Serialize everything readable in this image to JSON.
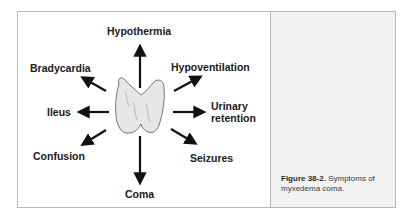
{
  "figure": {
    "number_label": "Figure 38-2.",
    "caption_text": " Symptoms of myxedema coma.",
    "center_image": "thyroid-gland"
  },
  "symptoms": {
    "top": "Hypothermia",
    "top_left": "Bradycardia",
    "top_right": "Hypoventilation",
    "left": "Ileus",
    "right_line1": "Urinary",
    "right_line2": "retention",
    "bottom_left": "Confusion",
    "bottom_right": "Seizures",
    "bottom": "Coma"
  },
  "colors": {
    "border": "#b8b8b8",
    "caption_bg": "#f2f2f2",
    "text": "#1a1a1a"
  }
}
